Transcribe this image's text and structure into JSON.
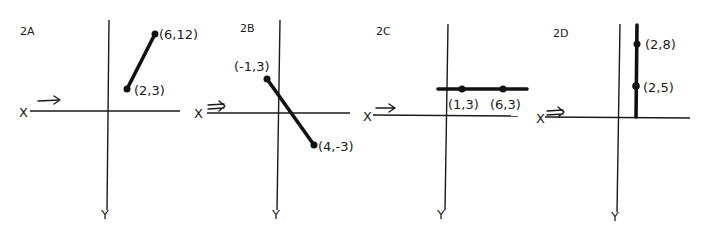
{
  "figure": {
    "axis_labels": {
      "x": "X",
      "y": "Y"
    },
    "colors": {
      "ink": "#1a1a1a",
      "background": "#ffffff"
    }
  },
  "panels": [
    {
      "id": "2A",
      "label": "2A",
      "points": [
        {
          "label": "(6,12)",
          "x": 6,
          "y": 12
        },
        {
          "label": "(2,3)",
          "x": 2,
          "y": 3
        }
      ],
      "line_type": "segment"
    },
    {
      "id": "2B",
      "label": "2B",
      "points": [
        {
          "label": "(-1,3)",
          "x": -1,
          "y": 3
        },
        {
          "label": "(4,-3)",
          "x": 4,
          "y": -3
        }
      ],
      "line_type": "segment"
    },
    {
      "id": "2C",
      "label": "2C",
      "points": [
        {
          "label": "(1,3)",
          "x": 1,
          "y": 3
        },
        {
          "label": "(6,3)",
          "x": 6,
          "y": 3
        }
      ],
      "line_type": "horizontal line"
    },
    {
      "id": "2D",
      "label": "2D",
      "points": [
        {
          "label": "(2,8)",
          "x": 2,
          "y": 8
        },
        {
          "label": "(2,5)",
          "x": 2,
          "y": 5
        }
      ],
      "line_type": "vertical line"
    }
  ]
}
